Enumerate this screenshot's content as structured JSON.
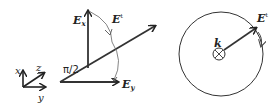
{
  "left_panel": {
    "coord_axes": {
      "x_label": "x",
      "y_label": "y",
      "z_label": "z"
    },
    "vectors": {
      "ex_label": "E",
      "ex_sub": "x",
      "ey_label": "E",
      "ey_sub": "y",
      "e_label": "E",
      "e_sup": "t"
    },
    "angle_label": "π/2"
  },
  "right_panel": {
    "k_label": "k",
    "e_label": "E",
    "e_sup": "t"
  },
  "colors": {
    "stroke": "#222222",
    "thin": "#555555"
  }
}
